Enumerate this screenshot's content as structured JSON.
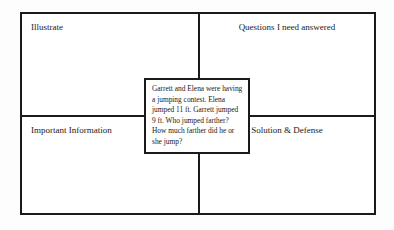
{
  "organizer": {
    "title_visible": false,
    "quadrants": [
      {
        "id": "illustrate",
        "label": "Illustrate",
        "position": "top-left",
        "align": "left"
      },
      {
        "id": "questions",
        "label": "Questions I need answered",
        "position": "top-right",
        "align": "center"
      },
      {
        "id": "information",
        "label": "Important Information",
        "position": "bottom-left",
        "align": "left"
      },
      {
        "id": "solution",
        "label": "Solution & Defense",
        "position": "bottom-right",
        "align": "center"
      }
    ],
    "center_box": {
      "text": "Garrett and Elena were having a jumping contest. Elena jumped 11 ft. Garrett jumped 9 ft. Who jumped farther? How much farther did he or she jump?",
      "lines": [
        "Garrett and Elena were",
        "having a jumping contest.",
        "Elena jumped 11 ft. Garrett",
        "jumped 9 ft. Who jumped",
        "farther? How much farther",
        "did he or she jump?"
      ]
    },
    "colors": {
      "border": "#1a1a1a",
      "background": "#ffffff",
      "page_background": "#fdfdfd",
      "text": "#1a1a1a"
    }
  }
}
